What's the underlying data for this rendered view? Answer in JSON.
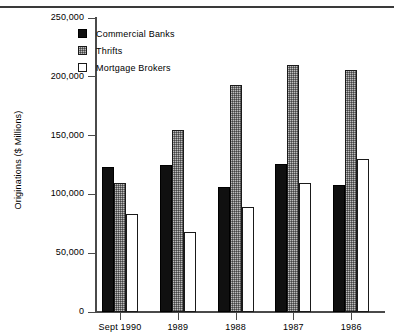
{
  "chart_data": {
    "type": "bar",
    "title": "",
    "subtitle": "",
    "xlabel": "",
    "ylabel": "Originations ($ Millions)",
    "categories": [
      "Sept 1990",
      "1989",
      "1988",
      "1987",
      "1986"
    ],
    "series": [
      {
        "name": "Commercial Banks",
        "color": "#101010",
        "values": [
          123000,
          125000,
          106000,
          126000,
          108000
        ]
      },
      {
        "name": "Thrifts",
        "color": "#bdbdbd",
        "values": [
          110000,
          155000,
          193000,
          210000,
          206000
        ]
      },
      {
        "name": "Mortgage Brokers",
        "color": "#ffffff",
        "values": [
          83000,
          68000,
          89000,
          110000,
          130000
        ]
      }
    ],
    "ylim": [
      0,
      250000
    ],
    "ytick_values": [
      0,
      50000,
      100000,
      150000,
      200000,
      250000
    ],
    "ytick_labels": [
      "0",
      "50,000",
      "100,000",
      "150,000",
      "200,000",
      "250,000"
    ],
    "grid": false,
    "legend_position": "top-left-inside",
    "legend_entries": [
      "Commercial Banks",
      "Thrifts",
      "Mortgage Brokers"
    ]
  },
  "legend": {
    "items": [
      {
        "label": "Commercial Banks",
        "swatch": "commercial"
      },
      {
        "label": "Thrifts",
        "swatch": "thrifts"
      },
      {
        "label": "Mortgage Brokers",
        "swatch": "brokers"
      }
    ]
  },
  "axes": {
    "y_title": "Originations ($ Millions)"
  },
  "colors": {
    "commercial_banks": "#101010",
    "thrifts": "#bdbdbd",
    "mortgage_brokers": "#ffffff",
    "axis": "#4a4a4a",
    "rule": "#3a3a3a"
  }
}
